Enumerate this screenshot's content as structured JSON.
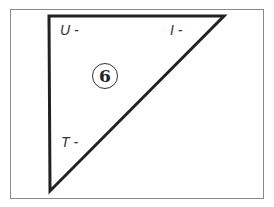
{
  "diagram": {
    "shape": "right-triangle",
    "frame_color": "#8a8a8a",
    "stroke_color": "#222222",
    "vertices": [
      [
        49,
        16
      ],
      [
        224,
        16
      ],
      [
        50,
        191
      ]
    ],
    "labels": {
      "top_left": "U -",
      "top_right": "I -",
      "left_lower": "T -"
    },
    "badge": "6"
  }
}
